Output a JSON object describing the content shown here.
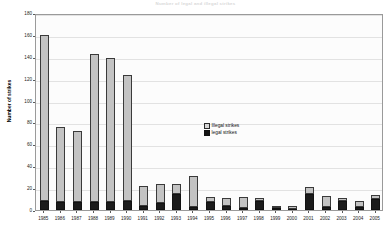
{
  "chart_data": {
    "type": "bar",
    "subtype": "stacked-bar",
    "title": "Number of legal and illegal strikes",
    "xlabel": "",
    "ylabel": "Number of strikes",
    "ylim": [
      0,
      180
    ],
    "ytick_step": 20,
    "yticks": [
      0,
      20,
      40,
      60,
      80,
      100,
      120,
      140,
      160,
      180
    ],
    "ytick_labels": [
      "0",
      "20",
      "40",
      "60",
      "80",
      "100",
      "120",
      "140",
      "160",
      "180"
    ],
    "grid": true,
    "grid_axis": "y",
    "legend_position": "center",
    "categories": [
      "1985",
      "1986",
      "1987",
      "1988",
      "1989",
      "1990",
      "1991",
      "1992",
      "1993",
      "1994",
      "1995",
      "1996",
      "1997",
      "1998",
      "1999",
      "2000",
      "2001",
      "2002",
      "2003",
      "2004",
      "2005"
    ],
    "series": [
      {
        "name": "Illegal strikes",
        "color": "#c3c3c3",
        "values": [
          152,
          69,
          65,
          136,
          132,
          115,
          18,
          18,
          9,
          28,
          5,
          7,
          10,
          3,
          1,
          3,
          6,
          10,
          3,
          5,
          4
        ]
      },
      {
        "name": "legal strikes",
        "color": "#1b1b1b",
        "values": [
          8,
          7,
          7,
          7,
          7,
          8,
          4,
          6,
          15,
          3,
          7,
          4,
          2,
          8,
          2,
          1,
          15,
          3,
          8,
          3,
          10
        ]
      }
    ],
    "totals": [
      160,
      76,
      72,
      143,
      139,
      123,
      22,
      24,
      24,
      31,
      12,
      11,
      12,
      11,
      3,
      4,
      21,
      13,
      11,
      8,
      14
    ]
  },
  "legend": {
    "items": [
      {
        "label": "Illegal strikes",
        "marker": "square-light"
      },
      {
        "label": "legal strikes",
        "marker": "square-dark"
      }
    ]
  }
}
